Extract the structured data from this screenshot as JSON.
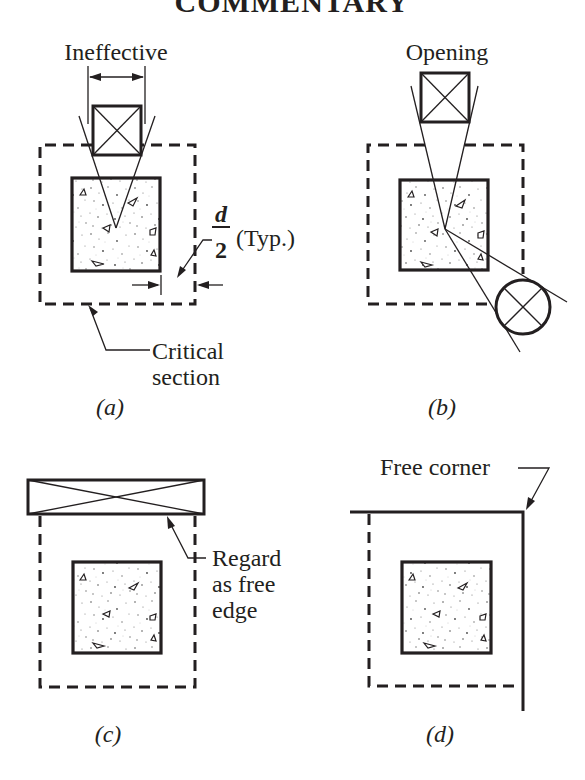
{
  "header": {
    "title": "COMMENTARY"
  },
  "panels": [
    {
      "id": "a",
      "caption": "(a)",
      "callouts": {
        "top": "Ineffective",
        "dimension_numerator": "d",
        "dimension_denominator": "2",
        "dimension_suffix": "(Typ.)",
        "section_line1": "Critical",
        "section_line2": "section"
      }
    },
    {
      "id": "b",
      "caption": "(b)",
      "callouts": {
        "top": "Opening"
      }
    },
    {
      "id": "c",
      "caption": "(c)",
      "callouts": {
        "edge_line1": "Regard",
        "edge_line2": "as free",
        "edge_line3": "edge"
      }
    },
    {
      "id": "d",
      "caption": "(d)",
      "callouts": {
        "corner": "Free corner"
      }
    }
  ],
  "colors": {
    "ink": "#231f20",
    "background": "#ffffff",
    "concrete_speckle": "#6b6b6b"
  }
}
